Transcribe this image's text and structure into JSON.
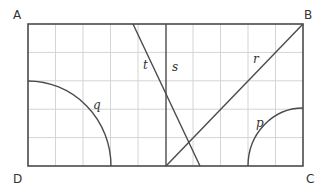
{
  "diagram": {
    "vertices": {
      "A": {
        "label": "A",
        "x": 13,
        "y": 19
      },
      "B": {
        "label": "B",
        "x": 304,
        "y": 19
      },
      "C": {
        "label": "C",
        "x": 306,
        "y": 183
      },
      "D": {
        "label": "D",
        "x": 13,
        "y": 183
      }
    },
    "lines": {
      "t": {
        "label": "t",
        "lx": 143,
        "ly": 69
      },
      "s": {
        "label": "s",
        "lx": 172,
        "ly": 71
      },
      "r": {
        "label": "r",
        "lx": 253,
        "ly": 63
      },
      "q": {
        "label": "q",
        "lx": 93,
        "ly": 109
      },
      "p": {
        "label": "p",
        "lx": 256,
        "ly": 127
      }
    },
    "grid": {
      "columns": 10,
      "rows": 5
    },
    "colors": {
      "stroke": "#4a4a4a",
      "grid": "#d4d4d4"
    }
  }
}
